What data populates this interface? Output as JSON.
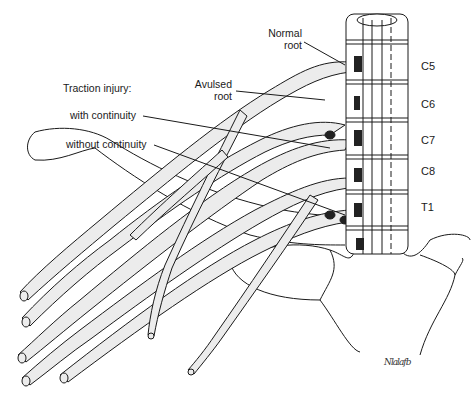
{
  "figure": {
    "labels": {
      "normal_root": [
        "Normal",
        "root"
      ],
      "avulsed_root": [
        "Avulsed",
        "root"
      ],
      "traction_injury": "Traction injury:",
      "with_continuity": "with continuity",
      "without_continuity": "without continuity"
    },
    "levels": [
      "C5",
      "C6",
      "C7",
      "C8",
      "T1"
    ],
    "signature": "Nlalafb",
    "colors": {
      "line": "#1a1a1a",
      "nerve_fill": "#e8e8e8",
      "background": "#ffffff"
    }
  }
}
